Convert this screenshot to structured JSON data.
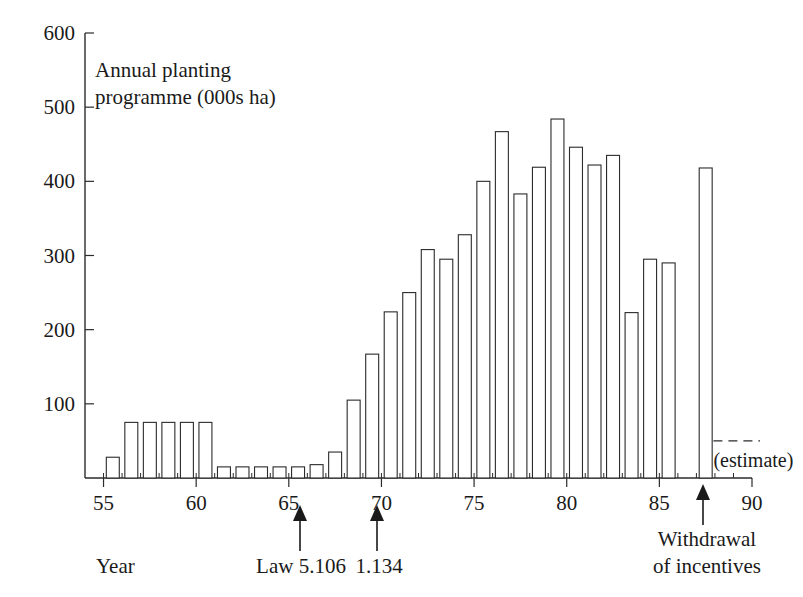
{
  "chart_data": {
    "type": "bar",
    "title": "Annual planting programme (000s ha)",
    "title_line1": "Annual planting",
    "title_line2": "programme (000s ha)",
    "xlabel": "Year",
    "ylabel": "",
    "xlim": [
      54,
      90
    ],
    "ylim": [
      0,
      600
    ],
    "grid": false,
    "legend": "none",
    "y_ticks": [
      600,
      500,
      400,
      300,
      200,
      100
    ],
    "x_ticks": [
      55,
      60,
      65,
      70,
      75,
      80,
      85,
      90
    ],
    "categories": [
      55,
      56,
      57,
      58,
      59,
      60,
      61,
      62,
      63,
      64,
      65,
      66,
      67,
      68,
      69,
      70,
      71,
      72,
      73,
      74,
      75,
      76,
      77,
      78,
      79,
      80,
      81,
      82,
      83,
      84,
      85,
      87
    ],
    "values": [
      28,
      75,
      75,
      75,
      75,
      75,
      15,
      15,
      15,
      15,
      15,
      18,
      35,
      105,
      167,
      224,
      250,
      308,
      295,
      328,
      400,
      467,
      383,
      419,
      484,
      446,
      422,
      435,
      223,
      295,
      290,
      418
    ],
    "estimate_bar_year": 87,
    "estimate_label": "(estimate)",
    "estimate_dash_value": 50,
    "annotations": [
      {
        "id": "law-5106",
        "label": "Law 5.106",
        "year": 66
      },
      {
        "id": "law-1134",
        "label": "1.134",
        "year": 70
      },
      {
        "id": "withdrawal",
        "label_line1": "Withdrawal",
        "label_line2": "of incentives",
        "year": 87
      }
    ],
    "colors": {
      "bar_fill": "#ffffff",
      "bar_stroke": "#2b2b2b",
      "axis": "#2b2b2b",
      "text": "#1a1a1a",
      "background": "#ffffff"
    }
  },
  "axis": {
    "y_tick_labels": [
      "600",
      "500",
      "400",
      "300",
      "200",
      "100"
    ],
    "x_tick_labels": [
      "55",
      "60",
      "65",
      "70",
      "75",
      "80",
      "85",
      "90"
    ]
  },
  "labels": {
    "title_line1": "Annual planting",
    "title_line2": "programme (000s ha)",
    "year_label": "Year",
    "law_5106": "Law 5.106",
    "law_1134": "1.134",
    "withdrawal_line1": "Withdrawal",
    "withdrawal_line2": "of incentives",
    "estimate": "(estimate)"
  }
}
